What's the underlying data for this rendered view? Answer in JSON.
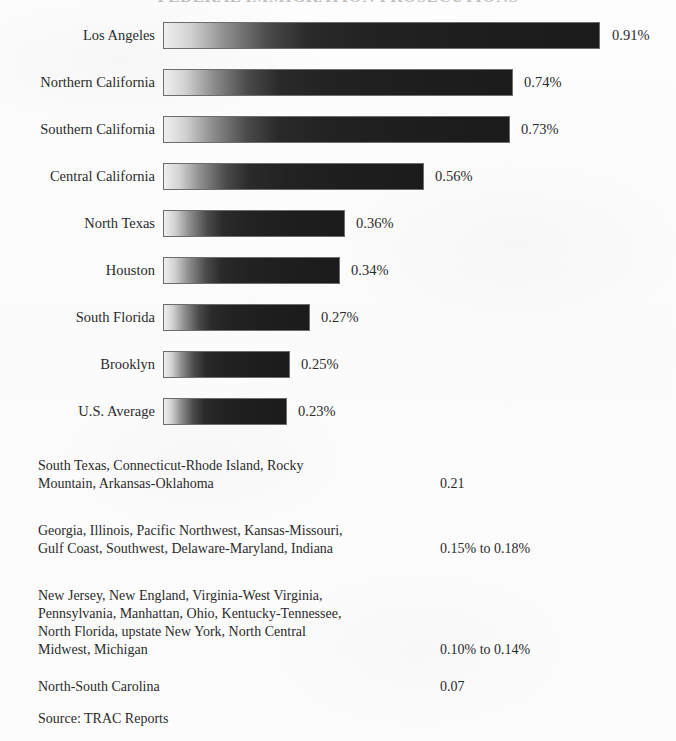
{
  "title": "FEDERAL IMMIGRATION PROSECUTIONS",
  "source": "Source: TRAC Reports",
  "chart_data": {
    "type": "bar",
    "title": "FEDERAL IMMIGRATION PROSECUTIONS",
    "orientation": "horizontal",
    "xlabel": "",
    "ylabel": "",
    "xlim": [
      0,
      1.0
    ],
    "grid": false,
    "legend": false,
    "categories": [
      "Los Angeles",
      "Northern California",
      "Southern California",
      "Central California",
      "North Texas",
      "Houston",
      "South Florida",
      "Brooklyn",
      "U.S. Average"
    ],
    "values": [
      0.91,
      0.74,
      0.73,
      0.56,
      0.36,
      0.34,
      0.27,
      0.25,
      0.23
    ],
    "value_labels": [
      "0.91%",
      "0.74%",
      "0.73%",
      "0.56%",
      "0.36%",
      "0.34%",
      "0.27%",
      "0.25%",
      "0.23%"
    ],
    "additional_rows": [
      {
        "names": [
          "South Texas, Connecticut-Rhode Island, Rocky",
          "Mountain, Arkansas-Oklahoma"
        ],
        "value": "0.21"
      },
      {
        "names": [
          "Georgia, Illinois, Pacific Northwest, Kansas-Missouri,",
          "Gulf Coast, Southwest, Delaware-Maryland, Indiana"
        ],
        "value": "0.15% to 0.18%"
      },
      {
        "names": [
          "New Jersey, New England, Virginia-West Virginia,",
          "Pennsylvania, Manhattan, Ohio, Kentucky-Tennessee,",
          "North Florida, upstate New York, North Central",
          "Midwest, Michigan"
        ],
        "value": "0.10% to 0.14%"
      },
      {
        "names": [
          "North-South Carolina"
        ],
        "value": "0.07"
      }
    ]
  },
  "bars": [
    {
      "label": "Los Angeles",
      "value_label": "0.91%",
      "top": 22,
      "width": 437,
      "value_left": 612
    },
    {
      "label": "Northern California",
      "value_label": "0.74%",
      "top": 69,
      "width": 350,
      "value_left": 524
    },
    {
      "label": "Southern California",
      "value_label": "0.73%",
      "top": 116,
      "width": 347,
      "value_left": 521
    },
    {
      "label": "Central California",
      "value_label": "0.56%",
      "top": 163,
      "width": 261,
      "value_left": 435
    },
    {
      "label": "North Texas",
      "value_label": "0.36%",
      "top": 210,
      "width": 182,
      "value_left": 356
    },
    {
      "label": "Houston",
      "value_label": "0.34%",
      "top": 257,
      "width": 177,
      "value_left": 351
    },
    {
      "label": "South Florida",
      "value_label": "0.27%",
      "top": 304,
      "width": 147,
      "value_left": 321
    },
    {
      "label": "Brooklyn",
      "value_label": "0.25%",
      "top": 351,
      "width": 127,
      "value_left": 301
    },
    {
      "label": "U.S. Average",
      "value_label": "0.23%",
      "top": 398,
      "width": 124,
      "value_left": 298
    }
  ],
  "text_rows": [
    {
      "top": 457,
      "value_top": 475,
      "value": "0.21",
      "lines": [
        "South Texas, Connecticut-Rhode Island, Rocky",
        "Mountain, Arkansas-Oklahoma"
      ]
    },
    {
      "top": 522,
      "value_top": 540,
      "value": "0.15% to 0.18%",
      "lines": [
        "Georgia, Illinois, Pacific Northwest, Kansas-Missouri,",
        "Gulf Coast, Southwest, Delaware-Maryland, Indiana"
      ]
    },
    {
      "top": 587,
      "value_top": 641,
      "value": "0.10% to 0.14%",
      "lines": [
        "New Jersey, New England, Virginia-West Virginia,",
        "Pennsylvania, Manhattan, Ohio, Kentucky-Tennessee,",
        "North Florida, upstate New York, North Central",
        "Midwest, Michigan"
      ]
    },
    {
      "top": 678,
      "value_top": 678,
      "value": "0.07",
      "lines": [
        "North-South Carolina"
      ]
    }
  ]
}
